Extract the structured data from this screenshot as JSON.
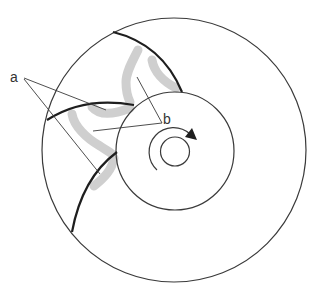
{
  "figure": {
    "type": "schematic cross-section of rotating drum with blades and deposits",
    "labels": {
      "a": "a",
      "b": "b"
    },
    "rotation_direction": "clockwise",
    "colors": {
      "outline": "#3a3a3a",
      "blade": "#1e1e1e",
      "deposit": "#cfcfcf",
      "background": "#ffffff"
    }
  }
}
